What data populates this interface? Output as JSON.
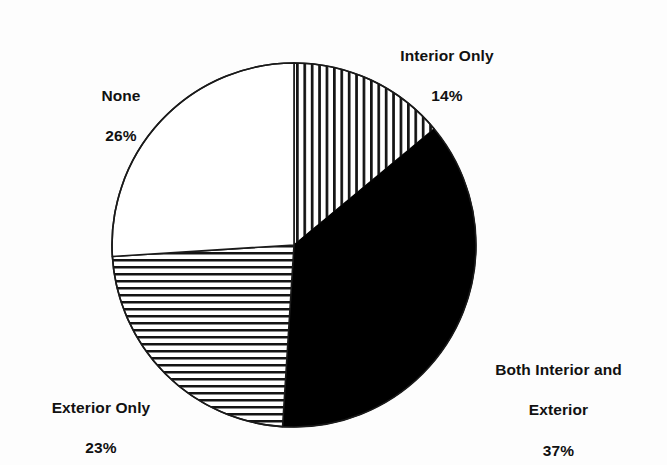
{
  "chart_data": {
    "type": "pie",
    "title": "",
    "subtitle": "",
    "xlabel": "",
    "ylabel": "",
    "legend_position": "none",
    "grid": false,
    "total": 100,
    "units": "%",
    "start_angle_deg": 0,
    "direction": "clockwise",
    "categories": [
      "Interior Only",
      "Both Interior and Exterior",
      "Exterior Only",
      "None"
    ],
    "values": [
      14,
      37,
      23,
      26
    ],
    "labels": [
      "14%",
      "37%",
      "23%",
      "26%"
    ],
    "slices": [
      {
        "name": "Interior Only",
        "label_line1": "Interior Only",
        "label_line2": "14%",
        "value": 14,
        "value_label": "14%",
        "fill": "vertical-hatch",
        "fill_color": "#ffffff",
        "stroke_color": "#1a1a1a",
        "start_deg": 0.0,
        "end_deg": 50.4
      },
      {
        "name": "Both Interior and Exterior",
        "label_line1": "Both Interior and",
        "label_line2": "Exterior",
        "label_line3": "37%",
        "value": 37,
        "value_label": "37%",
        "fill": "solid-black",
        "fill_color": "#000000",
        "stroke_color": "#000000",
        "start_deg": 50.4,
        "end_deg": 183.6
      },
      {
        "name": "Exterior Only",
        "label_line1": "Exterior Only",
        "label_line2": "23%",
        "value": 23,
        "value_label": "23%",
        "fill": "horizontal-hatch",
        "fill_color": "#ffffff",
        "stroke_color": "#1a1a1a",
        "start_deg": 183.6,
        "end_deg": 266.4
      },
      {
        "name": "None",
        "label_line1": "None",
        "label_line2": "26%",
        "value": 26,
        "value_label": "26%",
        "fill": "none-white",
        "fill_color": "#ffffff",
        "stroke_color": "#1a1a1a",
        "start_deg": 266.4,
        "end_deg": 360.0
      }
    ]
  },
  "colors": {
    "background": "#fdfdfd",
    "ink": "#111111",
    "outline": "#1a1a1a",
    "solid": "#000000"
  },
  "labels": {
    "interior": {
      "name": "Interior Only",
      "value": "14%"
    },
    "both": {
      "name_line1": "Both Interior and",
      "name_line2": "Exterior",
      "value": "37%"
    },
    "exterior": {
      "name": "Exterior Only",
      "value": "23%"
    },
    "none": {
      "name": "None",
      "value": "26%"
    }
  }
}
